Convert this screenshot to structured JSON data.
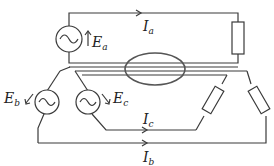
{
  "diagram": {
    "title": "",
    "labels": {
      "Ea": {
        "main": "E",
        "sub": "a"
      },
      "Eb": {
        "main": "E",
        "sub": "b"
      },
      "Ec": {
        "main": "E",
        "sub": "c"
      },
      "Ia": {
        "main": "I",
        "sub": "a"
      },
      "Ib": {
        "main": "I",
        "sub": "b"
      },
      "Ic": {
        "main": "I",
        "sub": "c"
      }
    },
    "components": [
      {
        "id": "source-a",
        "type": "ac-voltage-source",
        "label": "Ea"
      },
      {
        "id": "source-b",
        "type": "ac-voltage-source",
        "label": "Eb"
      },
      {
        "id": "source-c",
        "type": "ac-voltage-source",
        "label": "Ec"
      },
      {
        "id": "load-a",
        "type": "resistor"
      },
      {
        "id": "load-b",
        "type": "resistor"
      },
      {
        "id": "load-c",
        "type": "resistor"
      },
      {
        "id": "current-probe",
        "type": "ellipse-clamp"
      }
    ],
    "colors": {
      "line": "#3a3a3a",
      "background": "#ffffff"
    }
  }
}
